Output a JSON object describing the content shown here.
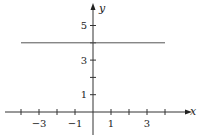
{
  "chart_data": {
    "type": "line",
    "title": "",
    "xlabel": "x",
    "ylabel": "y",
    "xlim": [
      -5,
      5
    ],
    "ylim": [
      -1,
      6
    ],
    "grid": false,
    "x_ticks": [
      -4,
      -3,
      -2,
      -1,
      1,
      2,
      3,
      4
    ],
    "x_tick_labels": [
      {
        "value": -3,
        "label": "−3"
      },
      {
        "value": -1,
        "label": "−1"
      },
      {
        "value": 1,
        "label": "1"
      },
      {
        "value": 3,
        "label": "3"
      }
    ],
    "y_ticks": [
      1,
      2,
      3,
      4,
      5
    ],
    "y_tick_labels": [
      {
        "value": 1,
        "label": "1"
      },
      {
        "value": 3,
        "label": "3"
      },
      {
        "value": 5,
        "label": "5"
      }
    ],
    "series": [
      {
        "name": "y = 4",
        "x": [
          -4,
          4
        ],
        "y": [
          4,
          4
        ],
        "color": "#555555"
      }
    ]
  }
}
